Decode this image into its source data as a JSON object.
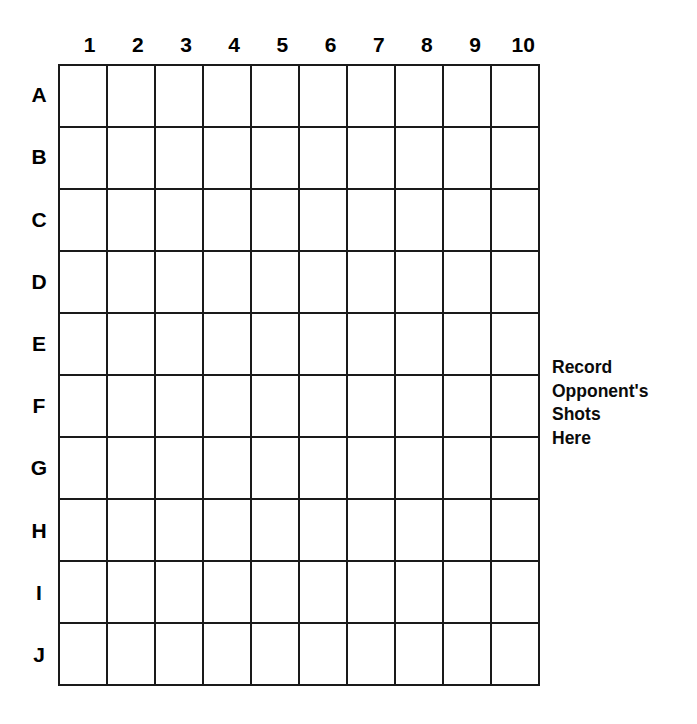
{
  "page": {
    "background_color": "#ffffff",
    "line_color": "#1a1a1a",
    "text_color": "#000000"
  },
  "board": {
    "rows": 10,
    "columns": 10,
    "column_headers": [
      "1",
      "2",
      "3",
      "4",
      "5",
      "6",
      "7",
      "8",
      "9",
      "10"
    ],
    "row_labels": [
      "A",
      "B",
      "C",
      "D",
      "E",
      "F",
      "G",
      "H",
      "I",
      "J"
    ],
    "cells": [
      [
        "",
        "",
        "",
        "",
        "",
        "",
        "",
        "",
        "",
        ""
      ],
      [
        "",
        "",
        "",
        "",
        "",
        "",
        "",
        "",
        "",
        ""
      ],
      [
        "",
        "",
        "",
        "",
        "",
        "",
        "",
        "",
        "",
        ""
      ],
      [
        "",
        "",
        "",
        "",
        "",
        "",
        "",
        "",
        "",
        ""
      ],
      [
        "",
        "",
        "",
        "",
        "",
        "",
        "",
        "",
        "",
        ""
      ],
      [
        "",
        "",
        "",
        "",
        "",
        "",
        "",
        "",
        "",
        ""
      ],
      [
        "",
        "",
        "",
        "",
        "",
        "",
        "",
        "",
        "",
        ""
      ],
      [
        "",
        "",
        "",
        "",
        "",
        "",
        "",
        "",
        "",
        ""
      ],
      [
        "",
        "",
        "",
        "",
        "",
        "",
        "",
        "",
        "",
        ""
      ],
      [
        "",
        "",
        "",
        "",
        "",
        "",
        "",
        "",
        "",
        ""
      ]
    ]
  },
  "annotation": {
    "lines": [
      "Record",
      "Opponent's",
      "Shots",
      "Here"
    ],
    "full_text": "Record Opponent's Shots Here"
  }
}
